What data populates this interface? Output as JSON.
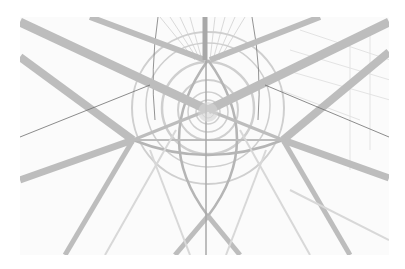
{
  "image": {
    "description": "Abstract architectural photograph looking up through a steel lattice tower with radiating beams and concentric rings, high-key grayscale",
    "alt": "Looking up inside a steel structure with radiating beams and concentric circles"
  },
  "colors": {
    "background": "#ffffff",
    "photo_bg": "#fbfbfb",
    "beam": "#bdbdbd",
    "beam_dark": "#9a9a9a",
    "ring": "#cfcfcf",
    "thin_line": "#6f6f6f"
  }
}
